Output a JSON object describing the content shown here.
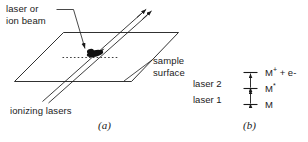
{
  "figure": {
    "panel_a": {
      "caption": "(a)",
      "labels": {
        "beam_source": "laser or\nion beam",
        "beam_source_line1": "laser or",
        "beam_source_line2": "ion beam",
        "sample_surface_line1": "sample",
        "sample_surface_line2": "surface",
        "ionizing_lasers": "ionizing lasers"
      },
      "colors": {
        "line": "#1a1a1a",
        "spot": "#111111",
        "background": "#ffffff"
      }
    },
    "panel_b": {
      "caption": "(b)",
      "laser_labels": [
        "laser 2",
        "laser 1"
      ],
      "states": [
        {
          "symbol": "M",
          "superscript": "+",
          "suffix": " + e-"
        },
        {
          "symbol": "M",
          "superscript": "*",
          "suffix": ""
        },
        {
          "symbol": "M",
          "superscript": "",
          "suffix": ""
        }
      ],
      "state_text": [
        "M+ + e-",
        "M*",
        "M"
      ],
      "colors": {
        "line": "#1a1a1a"
      }
    }
  }
}
